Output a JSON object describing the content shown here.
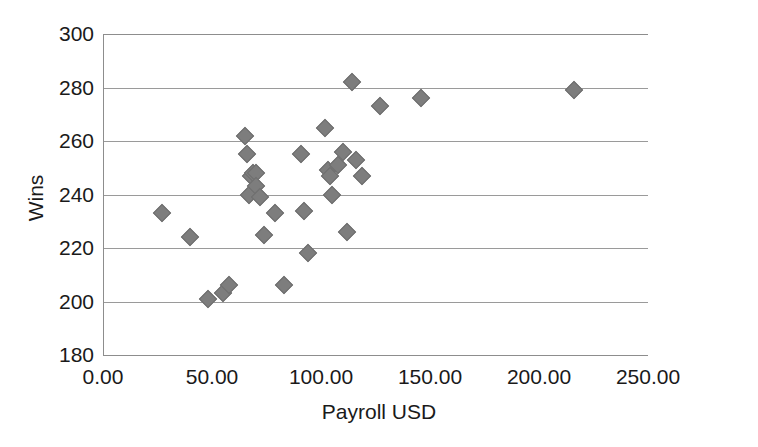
{
  "chart_data": {
    "type": "scatter",
    "title": "",
    "xlabel": "Payroll USD",
    "ylabel": "Wins",
    "xlim": [
      0,
      250
    ],
    "ylim": [
      180,
      300
    ],
    "grid": true,
    "legend": null,
    "xticks": [
      "0.00",
      "50.00",
      "100.00",
      "150.00",
      "200.00",
      "250.00"
    ],
    "xtick_values": [
      0,
      50,
      100,
      150,
      200,
      250
    ],
    "yticks": [
      "180",
      "200",
      "220",
      "240",
      "260",
      "280",
      "300"
    ],
    "ytick_values": [
      180,
      200,
      220,
      240,
      260,
      280,
      300
    ],
    "marker": "diamond",
    "marker_color": "#7d7d7d",
    "points": [
      {
        "x": 27,
        "y": 233
      },
      {
        "x": 40,
        "y": 224
      },
      {
        "x": 48,
        "y": 201
      },
      {
        "x": 55,
        "y": 203
      },
      {
        "x": 58,
        "y": 206
      },
      {
        "x": 65,
        "y": 262
      },
      {
        "x": 66,
        "y": 255
      },
      {
        "x": 67,
        "y": 240
      },
      {
        "x": 68,
        "y": 247
      },
      {
        "x": 69,
        "y": 248
      },
      {
        "x": 70,
        "y": 248
      },
      {
        "x": 70,
        "y": 243
      },
      {
        "x": 72,
        "y": 239
      },
      {
        "x": 74,
        "y": 225
      },
      {
        "x": 79,
        "y": 233
      },
      {
        "x": 83,
        "y": 206
      },
      {
        "x": 91,
        "y": 255
      },
      {
        "x": 92,
        "y": 234
      },
      {
        "x": 94,
        "y": 218
      },
      {
        "x": 102,
        "y": 265
      },
      {
        "x": 103,
        "y": 249
      },
      {
        "x": 104,
        "y": 247
      },
      {
        "x": 105,
        "y": 240
      },
      {
        "x": 108,
        "y": 251
      },
      {
        "x": 110,
        "y": 256
      },
      {
        "x": 112,
        "y": 226
      },
      {
        "x": 114,
        "y": 282
      },
      {
        "x": 116,
        "y": 253
      },
      {
        "x": 119,
        "y": 247
      },
      {
        "x": 127,
        "y": 273
      },
      {
        "x": 146,
        "y": 276
      },
      {
        "x": 216,
        "y": 279
      }
    ]
  },
  "axes": {
    "y_title": "Wins",
    "x_title": "Payroll USD"
  }
}
